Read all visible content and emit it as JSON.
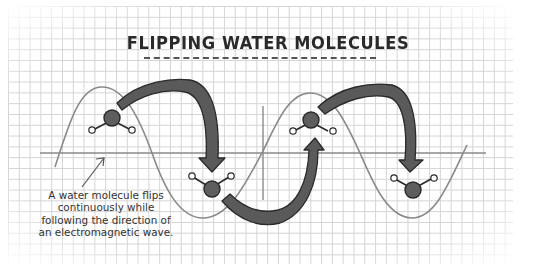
{
  "title": "FLIPPING WATER MOLECULES",
  "caption": {
    "lines": [
      "A water molecule flips",
      "continuously while",
      "following the direction of",
      "an electromagnetic wave."
    ]
  },
  "colors": {
    "grid": "#d4d4d4",
    "wave": "#8a8a8a",
    "axis": "#8a8a8a",
    "arrow_fill": "#5a5a5a",
    "arrow_stroke": "#2a2a2a",
    "oxygen_fill": "#5e5e5e",
    "hydrogen_fill": "#ffffff",
    "text": "#333333"
  },
  "diagram": {
    "axis_label": "wave axis",
    "molecules": [
      {
        "id": 1,
        "position": "crest-1",
        "orientation": "hydrogens-down"
      },
      {
        "id": 2,
        "position": "trough-1",
        "orientation": "hydrogens-up"
      },
      {
        "id": 3,
        "position": "crest-2",
        "orientation": "hydrogens-down"
      },
      {
        "id": 4,
        "position": "trough-2",
        "orientation": "hydrogens-up"
      }
    ],
    "arrows": [
      {
        "from": "crest-1",
        "to": "trough-1",
        "direction": "down"
      },
      {
        "from": "trough-1",
        "to": "crest-2",
        "direction": "up"
      },
      {
        "from": "crest-2",
        "to": "trough-2",
        "direction": "down"
      }
    ]
  }
}
